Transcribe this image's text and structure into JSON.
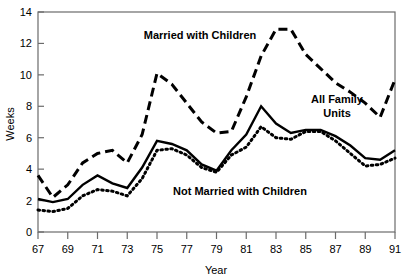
{
  "chart_data": {
    "type": "line",
    "title": "",
    "xlabel": "Year",
    "ylabel": "Weeks",
    "xlim": [
      67,
      91
    ],
    "ylim": [
      0,
      14
    ],
    "grid": false,
    "legend_position": "inline-annotations",
    "x_tick_labels": [
      "67",
      "69",
      "71",
      "73",
      "75",
      "77",
      "79",
      "81",
      "83",
      "85",
      "87",
      "89",
      "91"
    ],
    "x_ticks": [
      67,
      69,
      71,
      73,
      75,
      77,
      79,
      81,
      83,
      85,
      87,
      89,
      91
    ],
    "y_tick_labels": [
      "0",
      "2",
      "4",
      "6",
      "8",
      "10",
      "12",
      "14"
    ],
    "y_ticks": [
      0,
      2,
      4,
      6,
      8,
      10,
      12,
      14
    ],
    "x": [
      67,
      68,
      69,
      70,
      71,
      72,
      73,
      74,
      75,
      76,
      77,
      78,
      79,
      80,
      81,
      82,
      83,
      84,
      85,
      86,
      87,
      88,
      89,
      90,
      91
    ],
    "series": [
      {
        "name": "Married with Children",
        "style": "dashed",
        "color": "#000000",
        "values": [
          3.6,
          2.2,
          3.0,
          4.4,
          5.0,
          5.2,
          4.4,
          6.2,
          10.1,
          9.4,
          8.2,
          7.0,
          6.3,
          6.4,
          8.6,
          11.2,
          12.9,
          12.9,
          11.3,
          10.4,
          9.5,
          8.9,
          8.2,
          7.3,
          9.7
        ]
      },
      {
        "name": "All Family Units",
        "style": "solid",
        "color": "#000000",
        "values": [
          2.1,
          1.9,
          2.1,
          3.0,
          3.6,
          3.1,
          2.8,
          4.1,
          5.8,
          5.6,
          5.2,
          4.3,
          3.9,
          5.2,
          6.2,
          8.0,
          6.9,
          6.3,
          6.5,
          6.5,
          6.1,
          5.5,
          4.7,
          4.6,
          5.2
        ]
      },
      {
        "name": "Not Married with Children",
        "style": "dotted",
        "color": "#000000",
        "values": [
          1.4,
          1.3,
          1.5,
          2.3,
          2.7,
          2.6,
          2.3,
          3.4,
          5.2,
          5.3,
          4.9,
          4.1,
          3.8,
          4.9,
          5.4,
          6.7,
          6.0,
          5.9,
          6.4,
          6.4,
          5.8,
          5.0,
          4.2,
          4.3,
          4.7
        ]
      }
    ],
    "annotations": [
      {
        "text": "Married with Children",
        "x_px": 200,
        "y_px": 39,
        "anchor": "middle"
      },
      {
        "text": "All Family Units",
        "x_px": 337,
        "y_px": 103,
        "anchor": "middle"
      },
      {
        "text": "Not Married with Children",
        "x_px": 240,
        "y_px": 195,
        "anchor": "middle"
      }
    ],
    "annotation_lines": {
      "all_family_units": [
        "All Family",
        "Units"
      ]
    }
  },
  "axes": {
    "y_label": "Weeks",
    "x_label": "Year"
  }
}
